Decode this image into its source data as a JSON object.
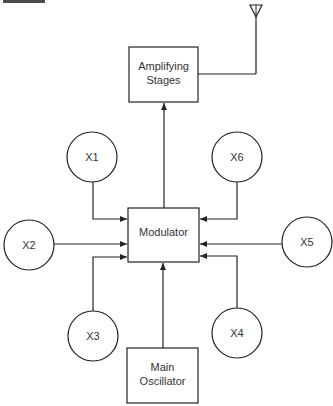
{
  "diagram": {
    "colors": {
      "line": "#222222",
      "text": "#333333",
      "background": "#ffffff"
    },
    "blocks": {
      "amplifying": {
        "line1": "Amplifying",
        "line2": "Stages"
      },
      "modulator": {
        "label": "Modulator"
      },
      "oscillator": {
        "line1": "Main",
        "line2": "Oscillator"
      }
    },
    "inputs": [
      {
        "id": "x1",
        "label": "X1"
      },
      {
        "id": "x2",
        "label": "X2"
      },
      {
        "id": "x3",
        "label": "X3"
      },
      {
        "id": "x4",
        "label": "X4"
      },
      {
        "id": "x5",
        "label": "X5"
      },
      {
        "id": "x6",
        "label": "X6"
      }
    ],
    "antenna": {
      "icon": "antenna-icon"
    }
  }
}
